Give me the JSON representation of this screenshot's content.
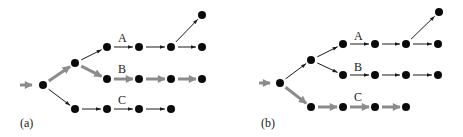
{
  "colors": {
    "node": "#0a0a0a",
    "thin_edge": "#1a1a1a",
    "highlight_edge": "#8c8c8c"
  },
  "panels": [
    {
      "id": "a",
      "caption": "(a)",
      "caption_pos": [
        20,
        127
      ],
      "input": {
        "from": [
          20,
          85
        ],
        "to": [
          38,
          85
        ],
        "highlight": true
      },
      "nodes": {
        "root": [
          43,
          85
        ],
        "mid": [
          75,
          63
        ],
        "A0": [
          107,
          47
        ],
        "A1": [
          139,
          47
        ],
        "A2": [
          171,
          47
        ],
        "A3": [
          202,
          47
        ],
        "Atop": [
          202,
          15
        ],
        "B0": [
          107,
          79
        ],
        "B1": [
          139,
          79
        ],
        "B2": [
          171,
          79
        ],
        "B3": [
          202,
          79
        ],
        "C0": [
          75,
          109
        ],
        "C1": [
          107,
          109
        ],
        "C2": [
          139,
          109
        ],
        "C3": [
          171,
          109
        ]
      },
      "edges": [
        [
          "root",
          "mid",
          true
        ],
        [
          "mid",
          "A0",
          false
        ],
        [
          "mid",
          "B0",
          true
        ],
        [
          "root",
          "C0",
          false
        ],
        [
          "A0",
          "A1",
          false
        ],
        [
          "A1",
          "A2",
          false
        ],
        [
          "A2",
          "A3",
          false
        ],
        [
          "A2",
          "Atop",
          false
        ],
        [
          "B0",
          "B1",
          true
        ],
        [
          "B1",
          "B2",
          true
        ],
        [
          "B2",
          "B3",
          true
        ],
        [
          "C0",
          "C1",
          false
        ],
        [
          "C1",
          "C2",
          false
        ],
        [
          "C2",
          "C3",
          false
        ]
      ],
      "branch_labels": [
        {
          "text": "A",
          "pos": [
            118,
            42
          ]
        },
        {
          "text": "B",
          "pos": [
            118,
            73
          ]
        },
        {
          "text": "C",
          "pos": [
            118,
            104
          ]
        }
      ]
    },
    {
      "id": "b",
      "caption": "(b)",
      "caption_pos": [
        261,
        127
      ],
      "input": {
        "from": [
          259,
          83
        ],
        "to": [
          276,
          83
        ],
        "highlight": true
      },
      "nodes": {
        "root": [
          280,
          83
        ],
        "mid": [
          311,
          60
        ],
        "A0": [
          343,
          44
        ],
        "A1": [
          375,
          44
        ],
        "A2": [
          406,
          44
        ],
        "A3": [
          438,
          44
        ],
        "Atop": [
          439,
          12
        ],
        "B0": [
          343,
          75
        ],
        "B1": [
          375,
          75
        ],
        "B2": [
          406,
          75
        ],
        "B3": [
          438,
          75
        ],
        "C0": [
          311,
          107
        ],
        "C1": [
          343,
          107
        ],
        "C2": [
          375,
          107
        ],
        "C3": [
          406,
          107
        ]
      },
      "edges": [
        [
          "root",
          "mid",
          false
        ],
        [
          "mid",
          "A0",
          false
        ],
        [
          "mid",
          "B0",
          false
        ],
        [
          "root",
          "C0",
          true
        ],
        [
          "A0",
          "A1",
          false
        ],
        [
          "A1",
          "A2",
          false
        ],
        [
          "A2",
          "A3",
          false
        ],
        [
          "A2",
          "Atop",
          false
        ],
        [
          "B0",
          "B1",
          false
        ],
        [
          "B1",
          "B2",
          false
        ],
        [
          "B2",
          "B3",
          false
        ],
        [
          "C0",
          "C1",
          true
        ],
        [
          "C1",
          "C2",
          true
        ],
        [
          "C2",
          "C3",
          true
        ]
      ],
      "branch_labels": [
        {
          "text": "A",
          "pos": [
            354,
            40
          ]
        },
        {
          "text": "B",
          "pos": [
            354,
            71
          ]
        },
        {
          "text": "C",
          "pos": [
            354,
            101
          ]
        }
      ]
    }
  ]
}
